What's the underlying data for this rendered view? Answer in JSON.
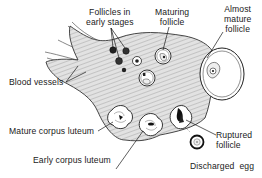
{
  "figure": {
    "labels": {
      "follicles_early_line1": "Follicles in",
      "follicles_early_line2": "early stages",
      "maturing_line1": "Maturing",
      "maturing_line2": "follicle",
      "almost_mature_line1": "Almost",
      "almost_mature_line2": "mature",
      "almost_mature_line3": "follicle",
      "blood_vessels": "Blood vessels",
      "mature_corpus_luteum": "Mature corpus luteum",
      "early_corpus_luteum": "Early corpus luteum",
      "ruptured_line1": "Ruptured",
      "ruptured_line2": "follicle",
      "discharged_egg": "Discharged  egg"
    },
    "colors": {
      "ink": "#1a1a1a",
      "tissue_fill": "#d4d4d4",
      "background": "#ffffff"
    }
  }
}
